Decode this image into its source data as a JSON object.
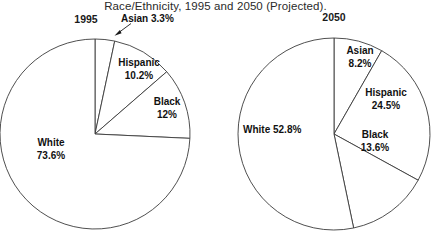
{
  "chart_data": {
    "type": "pie",
    "title": "Race/Ethnicity, 1995 and 2050 (Projected).",
    "charts": [
      {
        "name": "1995",
        "year_label": "1995",
        "center": [
          95,
          134
        ],
        "radius": 95,
        "categories": [
          "Asian",
          "Hispanic",
          "Black",
          "White"
        ],
        "values": [
          3.3,
          10.2,
          12.0,
          73.6
        ],
        "slices": [
          {
            "label": "Asian",
            "value": 3.3,
            "text": "Asian 3.3%",
            "pct": "3.3%",
            "leader": true
          },
          {
            "label": "Hispanic",
            "value": 10.2,
            "text": "Hispanic",
            "pct": "10.2%",
            "leader": false
          },
          {
            "label": "Black",
            "value": 12.0,
            "text": "Black",
            "pct": "12%",
            "leader": false
          },
          {
            "label": "White",
            "value": 73.6,
            "text": "White",
            "pct": "73.6%",
            "leader": false
          }
        ]
      },
      {
        "name": "2050",
        "year_label": "2050",
        "center": [
          334,
          134
        ],
        "radius": 96,
        "categories": [
          "Asian",
          "Hispanic",
          "Black",
          "White"
        ],
        "values": [
          8.2,
          24.5,
          13.6,
          52.8
        ],
        "slices": [
          {
            "label": "Asian",
            "value": 8.2,
            "text": "Asian",
            "pct": "8.2%",
            "leader": false
          },
          {
            "label": "Hispanic",
            "value": 24.5,
            "text": "Hispanic",
            "pct": "24.5%",
            "leader": false
          },
          {
            "label": "Black",
            "value": 13.6,
            "text": "Black",
            "pct": "13.6%",
            "leader": false
          },
          {
            "label": "White",
            "value": 52.8,
            "text": "White 52.8%",
            "pct": "",
            "leader": false
          }
        ]
      }
    ],
    "xlabel": "",
    "ylabel": "",
    "legend": "none",
    "grid": false,
    "colors": {
      "background": "#ffffff",
      "slice_fill": "#ffffff",
      "outline": "#3b3b3b",
      "text": "#111111"
    }
  },
  "figure": {
    "title": "Race/Ethnicity, 1995 and 2050 (Projected).",
    "left": {
      "year": "1995",
      "asian_label": "Asian 3.3%",
      "hispanic_name": "Hispanic",
      "hispanic_pct": "10.2%",
      "black_name": "Black",
      "black_pct": "12%",
      "white_name": "White",
      "white_pct": "73.6%"
    },
    "right": {
      "year": "2050",
      "asian_name": "Asian",
      "asian_pct": "8.2%",
      "hispanic_name": "Hispanic",
      "hispanic_pct": "24.5%",
      "black_name": "Black",
      "black_pct": "13.6%",
      "white_label": "White 52.8%"
    }
  }
}
